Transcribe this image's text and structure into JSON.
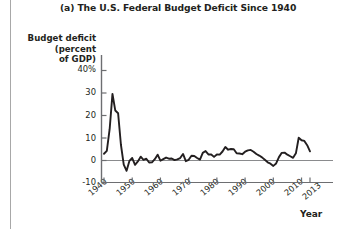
{
  "figure": {
    "title": "(a) The U.S. Federal Budget Deficit Since 1940",
    "y_axis_title_line1": "Budget deficit",
    "y_axis_title_line2": "(percent",
    "y_axis_title_line3": "of GDP)",
    "x_axis_title": "Year",
    "line_color": "#231f20",
    "axis_color": "#6d6e71",
    "background": "#ffffff"
  },
  "chart_data": {
    "type": "line",
    "title": "(a) The U.S. Federal Budget Deficit Since 1940",
    "xlabel": "Year",
    "ylabel": "Budget deficit (percent of GDP)",
    "xlim": [
      1940,
      2013
    ],
    "ylim": [
      -10,
      40
    ],
    "grid": false,
    "legend": null,
    "y_ticks": [
      "40%",
      "30",
      "20",
      "10",
      "0",
      "-10"
    ],
    "y_tick_values": [
      40,
      30,
      20,
      10,
      0,
      -10
    ],
    "x_ticks": [
      "1940",
      "1950",
      "1960",
      "1970",
      "1980",
      "1990",
      "2000",
      "2010",
      "2013"
    ],
    "x_tick_values": [
      1940,
      1950,
      1960,
      1970,
      1980,
      1990,
      2000,
      2010,
      2013
    ],
    "zero_line": 0,
    "x": [
      1940,
      1941,
      1942,
      1943,
      1944,
      1945,
      1946,
      1947,
      1948,
      1949,
      1950,
      1951,
      1952,
      1953,
      1954,
      1955,
      1956,
      1957,
      1958,
      1959,
      1960,
      1961,
      1962,
      1963,
      1964,
      1965,
      1966,
      1967,
      1968,
      1969,
      1970,
      1971,
      1972,
      1973,
      1974,
      1975,
      1976,
      1977,
      1978,
      1979,
      1980,
      1981,
      1982,
      1983,
      1984,
      1985,
      1986,
      1987,
      1988,
      1989,
      1990,
      1991,
      1992,
      1993,
      1994,
      1995,
      1996,
      1997,
      1998,
      1999,
      2000,
      2001,
      2002,
      2003,
      2004,
      2005,
      2006,
      2007,
      2008,
      2009,
      2010,
      2011,
      2012,
      2013
    ],
    "values": [
      3.0,
      4.3,
      13.9,
      29.6,
      22.2,
      21.0,
      7.0,
      -1.8,
      -4.6,
      -0.2,
      1.1,
      -1.9,
      -0.4,
      1.7,
      0.3,
      0.8,
      -0.9,
      -0.8,
      0.6,
      2.6,
      -0.1,
      0.6,
      1.3,
      0.8,
      0.9,
      0.2,
      0.5,
      1.1,
      2.9,
      -0.3,
      0.3,
      2.1,
      2.0,
      1.1,
      0.4,
      3.4,
      4.2,
      2.7,
      2.7,
      1.6,
      2.7,
      2.6,
      4.0,
      6.0,
      4.8,
      5.1,
      5.0,
      3.2,
      3.1,
      2.8,
      3.9,
      4.5,
      4.7,
      3.9,
      2.9,
      2.2,
      1.4,
      0.3,
      -0.8,
      -1.4,
      -2.4,
      -1.3,
      1.5,
      3.4,
      3.5,
      2.6,
      1.9,
      1.2,
      3.2,
      10.1,
      9.0,
      8.7,
      6.8,
      4.1
    ]
  }
}
